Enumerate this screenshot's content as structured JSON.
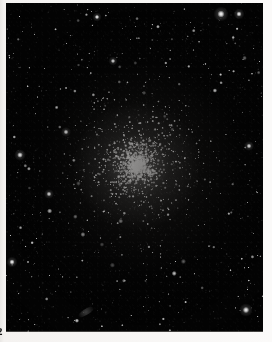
{
  "page": {
    "kind": "scanned-book-plate",
    "paper_color": "#f7f5f3",
    "folio_number": "2"
  },
  "plate": {
    "title": "globular star cluster photographic plate",
    "background_color": "#030303",
    "star_color": "#ffffff",
    "left": 6,
    "top": 3,
    "width": 257,
    "height": 329
  },
  "cluster": {
    "name": "globular-cluster",
    "center_x": 137,
    "center_y": 166,
    "core_radius": 17,
    "halo_radius": 52,
    "member_star_count": 1500,
    "peak_brightness": 1.0
  },
  "field": {
    "field_star_count": 420,
    "brightest_stars": [
      {
        "x": 221,
        "y": 14,
        "r": 3.6
      },
      {
        "x": 239,
        "y": 14,
        "r": 2.6
      },
      {
        "x": 246,
        "y": 310,
        "r": 3.2
      },
      {
        "x": 20,
        "y": 155,
        "r": 2.8
      },
      {
        "x": 12,
        "y": 262,
        "r": 2.6
      },
      {
        "x": 66,
        "y": 132,
        "r": 2.4
      },
      {
        "x": 49,
        "y": 194,
        "r": 2.4
      },
      {
        "x": 249,
        "y": 146,
        "r": 2.4
      },
      {
        "x": 97,
        "y": 17,
        "r": 2.2
      },
      {
        "x": 113,
        "y": 61,
        "r": 2.2
      }
    ]
  }
}
